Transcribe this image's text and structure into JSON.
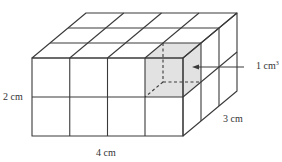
{
  "diagram": {
    "dimensions": {
      "length": {
        "label": "4 cm",
        "value": 4
      },
      "height": {
        "label": "2 cm",
        "value": 2
      },
      "depth": {
        "label": "3 cm",
        "value": 3
      }
    },
    "unit_cube": {
      "label_base": "1 cm",
      "label_exponent": "3",
      "highlight_color": "#e2e2e2"
    },
    "colors": {
      "line": "#3a3a3a",
      "background": "#ffffff",
      "text": "#333333"
    }
  }
}
